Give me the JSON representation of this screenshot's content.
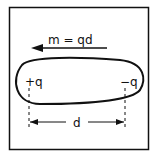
{
  "diagram": {
    "moment_label": "m = qd",
    "positive_charge_label": "+q",
    "negative_charge_label": "−q",
    "distance_label": "d",
    "colors": {
      "stroke": "#111111",
      "background": "#ffffff"
    }
  }
}
